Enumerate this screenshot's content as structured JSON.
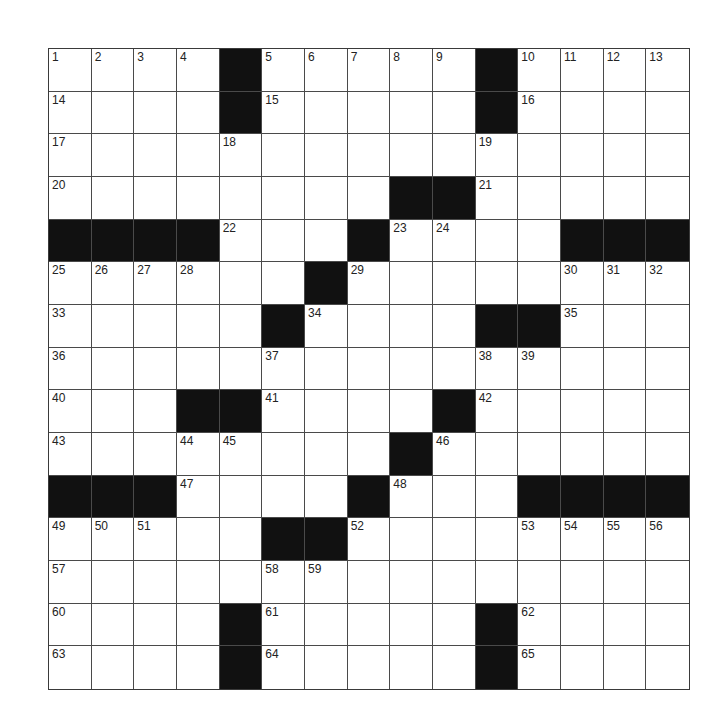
{
  "puzzle": {
    "rows": 15,
    "cols": 15,
    "grid": [
      [
        "1",
        "2",
        "3",
        "4",
        "#",
        "5",
        "6",
        "7",
        "8",
        "9",
        "#",
        "10",
        "11",
        "12",
        "13"
      ],
      [
        "14",
        "",
        "",
        "",
        "#",
        "15",
        "",
        "",
        "",
        "",
        "#",
        "16",
        "",
        "",
        ""
      ],
      [
        "17",
        "",
        "",
        "",
        "18",
        "",
        "",
        "",
        "",
        "",
        "19",
        "",
        "",
        "",
        ""
      ],
      [
        "20",
        "",
        "",
        "",
        "",
        "",
        "",
        "",
        "#",
        "#",
        "21",
        "",
        "",
        "",
        ""
      ],
      [
        "#",
        "#",
        "#",
        "#",
        "22",
        "",
        "",
        "#",
        "23",
        "24",
        "",
        "",
        "#",
        "#",
        "#"
      ],
      [
        "25",
        "26",
        "27",
        "28",
        "",
        "",
        "#",
        "29",
        "",
        "",
        "",
        "",
        "30",
        "31",
        "32"
      ],
      [
        "33",
        "",
        "",
        "",
        "",
        "#",
        "34",
        "",
        "",
        "",
        "#",
        "#",
        "35",
        "",
        ""
      ],
      [
        "36",
        "",
        "",
        "",
        "",
        "37",
        "",
        "",
        "",
        "",
        "38",
        "39",
        "",
        "",
        ""
      ],
      [
        "40",
        "",
        "",
        "#",
        "#",
        "41",
        "",
        "",
        "",
        "#",
        "42",
        "",
        "",
        "",
        ""
      ],
      [
        "43",
        "",
        "",
        "44",
        "45",
        "",
        "",
        "",
        "#",
        "46",
        "",
        "",
        "",
        "",
        ""
      ],
      [
        "#",
        "#",
        "#",
        "47",
        "",
        "",
        "",
        "#",
        "48",
        "",
        "",
        "#",
        "#",
        "#",
        "#"
      ],
      [
        "49",
        "50",
        "51",
        "",
        "",
        "#",
        "#",
        "52",
        "",
        "",
        "",
        "53",
        "54",
        "55",
        "56"
      ],
      [
        "57",
        "",
        "",
        "",
        "",
        "58",
        "59",
        "",
        "",
        "",
        "",
        "",
        "",
        "",
        ""
      ],
      [
        "60",
        "",
        "",
        "",
        "#",
        "61",
        "",
        "",
        "",
        "",
        "#",
        "62",
        "",
        "",
        ""
      ],
      [
        "63",
        "",
        "",
        "",
        "#",
        "64",
        "",
        "",
        "",
        "",
        "#",
        "65",
        "",
        "",
        ""
      ]
    ]
  },
  "colors": {
    "black_cell": "#111111",
    "white_cell": "#ffffff",
    "grid_line": "#4a4a4a",
    "number_text": "#222222"
  }
}
